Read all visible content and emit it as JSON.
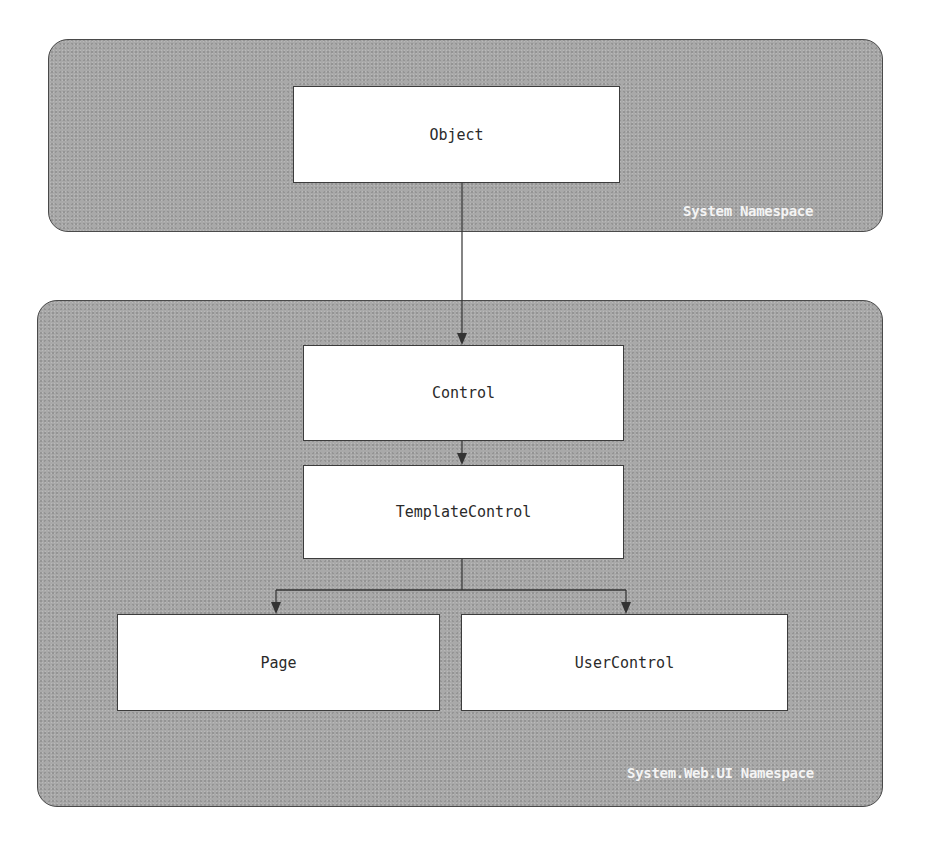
{
  "diagram": {
    "namespaces": [
      {
        "id": "system",
        "label": "System Namespace"
      },
      {
        "id": "system-web-ui",
        "label": "System.Web.UI Namespace"
      }
    ],
    "classes": [
      {
        "id": "object",
        "label": "Object",
        "namespace": "system"
      },
      {
        "id": "control",
        "label": "Control",
        "namespace": "system-web-ui"
      },
      {
        "id": "template-control",
        "label": "TemplateControl",
        "namespace": "system-web-ui"
      },
      {
        "id": "page",
        "label": "Page",
        "namespace": "system-web-ui"
      },
      {
        "id": "user-control",
        "label": "UserControl",
        "namespace": "system-web-ui"
      }
    ],
    "edges": [
      {
        "from": "object",
        "to": "control",
        "type": "inheritance-arrow"
      },
      {
        "from": "control",
        "to": "template-control",
        "type": "inheritance-arrow"
      },
      {
        "from": "template-control",
        "to": "page",
        "type": "inheritance-arrow"
      },
      {
        "from": "template-control",
        "to": "user-control",
        "type": "inheritance-arrow"
      }
    ],
    "colors": {
      "namespace_fill": "#a9a9a9",
      "namespace_border": "#4a4a4a",
      "class_fill": "#ffffff",
      "class_border": "#3c3c3c",
      "namespace_label": "#f4f4f4",
      "connector": "#333333"
    }
  }
}
